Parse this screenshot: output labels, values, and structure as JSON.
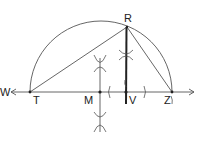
{
  "diagram": {
    "type": "geometric construction",
    "labels": {
      "W": "W",
      "T": "T",
      "M": "M",
      "V": "V",
      "Z": "Z",
      "R": "R"
    },
    "points": {
      "T": [
        30,
        92
      ],
      "M": [
        100,
        92
      ],
      "V": [
        126,
        92
      ],
      "Z": [
        172,
        92
      ],
      "R": [
        127,
        27
      ]
    },
    "semicircle": {
      "center": [
        101,
        92
      ],
      "radius": 71
    },
    "colors": {
      "stroke": "#333333",
      "background": "#ffffff"
    }
  }
}
